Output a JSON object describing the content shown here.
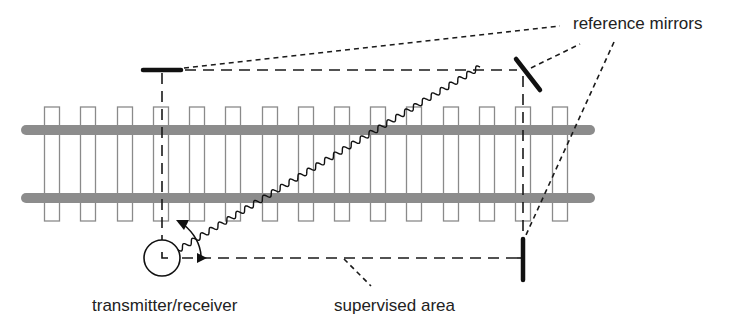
{
  "diagram": {
    "labels": {
      "reference_mirrors": "reference mirrors",
      "transmitter_receiver": "transmitter/receiver",
      "supervised_area": "supervised area"
    },
    "colors": {
      "rail": "#8c8c8c",
      "sleeper": "#8a8a8a",
      "line": "#1a1a1a",
      "text": "#222222"
    },
    "track": {
      "rail_y": [
        130,
        198
      ],
      "rail_x_start": 26,
      "rail_x_end": 590,
      "sleeper_x": [
        52,
        88,
        125,
        161,
        197,
        233,
        270,
        306,
        342,
        378,
        414,
        451,
        487,
        523,
        560
      ],
      "sleeper_top": 107,
      "sleeper_bottom": 221,
      "sleeper_width": 15
    },
    "components": {
      "transmitter": {
        "cx": 162,
        "cy": 258,
        "r": 18
      },
      "mirrors": [
        {
          "name": "left",
          "x1": 143,
          "y1": 70,
          "x2": 181,
          "y2": 70
        },
        {
          "name": "top-right",
          "x1": 517,
          "y1": 59,
          "x2": 540,
          "y2": 89
        },
        {
          "name": "bottom-right",
          "x1": 523,
          "y1": 238,
          "x2": 523,
          "y2": 280
        }
      ]
    }
  }
}
